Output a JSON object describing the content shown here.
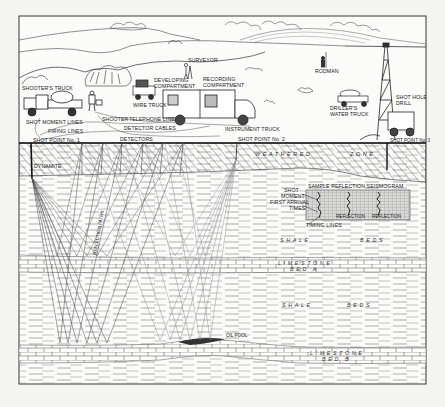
{
  "figure": {
    "type": "seismic-reflection-survey-illustration",
    "surface_labels": {
      "shooters_truck": "SHOOTER'S TRUCK",
      "shot_moment_lines": "SHOT MOMENT LINES",
      "firing_lines": "FIRING LINES",
      "shot_point_1": "SHOT POINT No. 1",
      "shooter": "SHOOTER",
      "telephone_line": "TELEPHONE LINE",
      "detector_cables": "DETECTOR CABLES",
      "detectors": "DETECTORS",
      "wire_truck": "WIRE TRUCK",
      "developing_compartment_1": "DEVELOPING",
      "developing_compartment_2": "COMPARTMENT",
      "surveyor": "SURVEYOR",
      "recording_compartment_1": "RECORDING",
      "recording_compartment_2": "COMPARTMENT",
      "instrument_truck": "INSTRUMENT TRUCK",
      "shot_point_2": "SHOT POINT No. 2",
      "rodman": "RODMAN",
      "drillers_water_truck_1": "DRILLER'S",
      "drillers_water_truck_2": "WATER TRUCK",
      "shot_hole_drill_1": "SHOT HOLE",
      "shot_hole_drill_2": "DRILL",
      "shot_point_3": "SHOT POINT No. 3"
    },
    "subsurface_labels": {
      "dynamite": "DYNAMITE",
      "weathered": "WEATHERED",
      "zone": "ZONE",
      "reflection_paths": "REFLECTION PATHS",
      "oil_pool": "OIL POOL"
    },
    "seismogram": {
      "title": "SAMPLE REFLECTION SEISMOGRAM",
      "shot_moment_1": "SHOT",
      "shot_moment_2": "MOMENT",
      "first_arrival_1": "FIRST ARRIVAL",
      "first_arrival_2": "TIMES",
      "timing_lines": "TIMING LINES",
      "reflection_1": "REFLECTION",
      "reflection_2": "REFLECTION"
    },
    "strata": {
      "shale_beds_1a": "SHALE",
      "shale_beds_1b": "BEDS",
      "limestone_a_1": "LIMESTONE",
      "limestone_a_2": "BED A",
      "shale_beds_2a": "SHALE",
      "shale_beds_2b": "BEDS",
      "limestone_b_1": "LIMESTONE",
      "limestone_b_2": "BED B"
    },
    "colors": {
      "ink": "#2a2a2a",
      "paper": "#f4f4f2",
      "frame_bg": "#fbfbfa",
      "grid": "#8a8a8a"
    }
  }
}
